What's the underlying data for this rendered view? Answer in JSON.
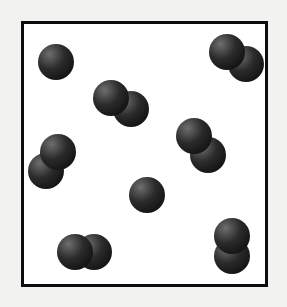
{
  "figure": {
    "background_color": "#f2f2f0",
    "canvas": {
      "width": 287,
      "height": 307
    }
  },
  "container": {
    "label": "container-frame",
    "shape": "rectangle",
    "x": 21,
    "y": 21,
    "width": 247,
    "height": 266,
    "border_width": 3,
    "border_color": "#0d0d0d",
    "fill_color": "#ffffff"
  },
  "particle_style": {
    "radius": 18,
    "base_color": "#2b2b2b",
    "shadow_color": "#111111",
    "highlight_color": "#6e6e6e",
    "edge_color": "#0a0a0a",
    "highlight_offset_x": "32%",
    "highlight_offset_y": "28%"
  },
  "legend": {
    "monatomic_label": "single atom",
    "diatomic_label": "diatomic molecule",
    "monatomic_count": 2,
    "diatomic_count": 6,
    "total_atoms": 14
  },
  "chart_data": {
    "type": "scatter",
    "xlabel": "",
    "ylabel": "",
    "xlim": [
      21,
      268
    ],
    "ylim": [
      21,
      287
    ],
    "grid": false,
    "legend_position": "none",
    "units": "pixels",
    "categories": [
      "monatomic",
      "diatomic"
    ],
    "values": [
      2,
      6
    ],
    "molecules": [
      {
        "id": "molecule-1",
        "type": "monatomic",
        "atoms": [
          {
            "cx": 56,
            "cy": 62,
            "r": 18
          }
        ]
      },
      {
        "id": "molecule-2",
        "type": "diatomic",
        "orientation": "diagonal-down-right",
        "atoms": [
          {
            "cx": 111,
            "cy": 98,
            "r": 18
          },
          {
            "cx": 131,
            "cy": 109,
            "r": 18
          }
        ]
      },
      {
        "id": "molecule-3",
        "type": "diatomic",
        "orientation": "diagonal-down-right",
        "atoms": [
          {
            "cx": 227,
            "cy": 52,
            "r": 18
          },
          {
            "cx": 246,
            "cy": 64,
            "r": 18
          }
        ]
      },
      {
        "id": "molecule-4",
        "type": "diatomic",
        "orientation": "diagonal-down-left",
        "atoms": [
          {
            "cx": 58,
            "cy": 152,
            "r": 18
          },
          {
            "cx": 46,
            "cy": 171,
            "r": 18
          }
        ]
      },
      {
        "id": "molecule-5",
        "type": "diatomic",
        "orientation": "diagonal-down-right",
        "atoms": [
          {
            "cx": 194,
            "cy": 136,
            "r": 18
          },
          {
            "cx": 208,
            "cy": 155,
            "r": 18
          }
        ]
      },
      {
        "id": "molecule-6",
        "type": "monatomic",
        "atoms": [
          {
            "cx": 147,
            "cy": 195,
            "r": 18
          }
        ]
      },
      {
        "id": "molecule-7",
        "type": "diatomic",
        "orientation": "horizontal",
        "atoms": [
          {
            "cx": 75,
            "cy": 252,
            "r": 18
          },
          {
            "cx": 94,
            "cy": 252,
            "r": 18
          }
        ]
      },
      {
        "id": "molecule-8",
        "type": "diatomic",
        "orientation": "vertical",
        "atoms": [
          {
            "cx": 232,
            "cy": 236,
            "r": 18
          },
          {
            "cx": 232,
            "cy": 256,
            "r": 18
          }
        ]
      }
    ]
  }
}
